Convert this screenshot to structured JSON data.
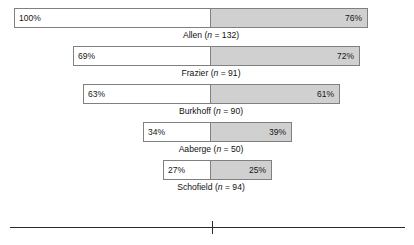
{
  "chart_data": {
    "type": "bar",
    "title": "",
    "subtitle": "",
    "xlabel": "",
    "ylabel": "",
    "orientation": "horizontal",
    "style": "paired-diverging-bar",
    "grid": false,
    "legend": null,
    "axis": {
      "line_x_start_px": 10,
      "line_x_end_px": 405,
      "line_y_px": 227,
      "center_tick_x_px": 212,
      "tick_labels": []
    },
    "center_divider_x_px": 211,
    "categories": [
      "Allen",
      "Frazier",
      "Burkhoff",
      "Aaberge",
      "Schofield"
    ],
    "series": [
      {
        "name": "left",
        "values": [
          100,
          69,
          63,
          34,
          27
        ],
        "value_labels": [
          "100%",
          "69%",
          "63%",
          "34%",
          "27%"
        ],
        "fill_color": "#ffffff"
      },
      {
        "name": "right",
        "values": [
          76,
          72,
          61,
          39,
          25
        ],
        "value_labels": [
          "76%",
          "72%",
          "61%",
          "39%",
          "25%"
        ],
        "fill_color": "#d0d0d0"
      }
    ],
    "studies": [
      {
        "name": "Allen",
        "n": 132,
        "label_prefix": "Allen (",
        "label_n_symbol": "n",
        "label_suffix": " = 132)",
        "left_pct": 100,
        "left_label": "100%",
        "right_pct": 76,
        "right_label": "76%",
        "bar_left_px": 14,
        "bar_divider_px": 211,
        "bar_right_px": 368,
        "bar_top_px": 8,
        "label_center_px": 211,
        "label_top_px": 31
      },
      {
        "name": "Frazier",
        "n": 91,
        "label_prefix": "Frazier (",
        "label_n_symbol": "n",
        "label_suffix": " = 91)",
        "left_pct": 69,
        "left_label": "69%",
        "right_pct": 72,
        "right_label": "72%",
        "bar_left_px": 73,
        "bar_divider_px": 211,
        "bar_right_px": 360,
        "bar_top_px": 46,
        "label_center_px": 211,
        "label_top_px": 69
      },
      {
        "name": "Burkhoff",
        "n": 90,
        "label_prefix": "Burkhoff (",
        "label_n_symbol": "n",
        "label_suffix": " = 90)",
        "left_pct": 63,
        "left_label": "63%",
        "right_pct": 61,
        "right_label": "61%",
        "bar_left_px": 83,
        "bar_divider_px": 211,
        "bar_right_px": 340,
        "bar_top_px": 84,
        "label_center_px": 211,
        "label_top_px": 107
      },
      {
        "name": "Aaberge",
        "n": 50,
        "label_prefix": "Aaberge (",
        "label_n_symbol": "n",
        "label_suffix": " = 50)",
        "left_pct": 34,
        "left_label": "34%",
        "right_pct": 39,
        "right_label": "39%",
        "bar_left_px": 143,
        "bar_divider_px": 211,
        "bar_right_px": 292,
        "bar_top_px": 122,
        "label_center_px": 211,
        "label_top_px": 145
      },
      {
        "name": "Schofield",
        "n": 94,
        "label_prefix": "Schofield (",
        "label_n_symbol": "n",
        "label_suffix": " = 94)",
        "left_pct": 27,
        "left_label": "27%",
        "right_pct": 25,
        "right_label": "25%",
        "bar_left_px": 163,
        "bar_divider_px": 211,
        "bar_right_px": 272,
        "bar_top_px": 160,
        "label_center_px": 211,
        "label_top_px": 183
      }
    ],
    "colors": {
      "left_fill": "#ffffff",
      "right_fill": "#d0d0d0",
      "bar_border": "#808080",
      "axis": "#2b2b2b",
      "text": "#111111",
      "background": "#ffffff"
    }
  }
}
